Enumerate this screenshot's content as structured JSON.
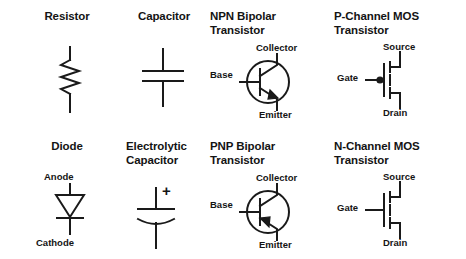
{
  "figure": {
    "background_color": "#ffffff",
    "ink_color": "#1a1a1a",
    "columns": 4,
    "rows": 2
  },
  "cells": [
    {
      "id": "resistor",
      "title": "Resistor",
      "title_align": "center",
      "symbol": "resistor-zigzag",
      "pins": []
    },
    {
      "id": "capacitor",
      "title": "Capacitor",
      "title_align": "center",
      "symbol": "capacitor-parallel-plates",
      "pins": []
    },
    {
      "id": "npn-bipolar-transistor",
      "title": "NPN Bipolar\nTransistor",
      "title_align": "left",
      "symbol": "npn-bipolar-transistor",
      "pins": [
        {
          "name": "collector",
          "label": "Collector"
        },
        {
          "name": "base",
          "label": "Base"
        },
        {
          "name": "emitter",
          "label": "Emitter"
        }
      ]
    },
    {
      "id": "p-channel-mos-transistor",
      "title": "P-Channel MOS\nTransistor",
      "title_align": "left",
      "symbol": "p-channel-mosfet",
      "pins": [
        {
          "name": "source",
          "label": "Source"
        },
        {
          "name": "gate",
          "label": "Gate"
        },
        {
          "name": "drain",
          "label": "Drain"
        }
      ]
    },
    {
      "id": "diode",
      "title": "Diode",
      "title_align": "center",
      "symbol": "diode",
      "pins": [
        {
          "name": "anode",
          "label": "Anode"
        },
        {
          "name": "cathode",
          "label": "Cathode"
        }
      ]
    },
    {
      "id": "electrolytic-capacitor",
      "title": "Electrolytic\nCapacitor",
      "title_align": "left",
      "symbol": "electrolytic-capacitor",
      "pins": [
        {
          "name": "positive-terminal",
          "label": "+"
        }
      ]
    },
    {
      "id": "pnp-bipolar-transistor",
      "title": "PNP Bipolar\nTransistor",
      "title_align": "left",
      "symbol": "pnp-bipolar-transistor",
      "pins": [
        {
          "name": "collector",
          "label": "Collector"
        },
        {
          "name": "base",
          "label": "Base"
        },
        {
          "name": "emitter",
          "label": "Emitter"
        }
      ]
    },
    {
      "id": "n-channel-mos-transistor",
      "title": "N-Channel MOS\nTransistor",
      "title_align": "left",
      "symbol": "n-channel-mosfet",
      "pins": [
        {
          "name": "source",
          "label": "Source"
        },
        {
          "name": "gate",
          "label": "Gate"
        },
        {
          "name": "drain",
          "label": "Drain"
        }
      ]
    }
  ]
}
